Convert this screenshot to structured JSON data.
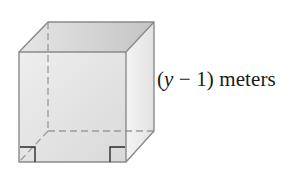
{
  "diagram": {
    "type": "cube",
    "edge_label": {
      "open_paren": "(",
      "variable": "y",
      "rest": " − 1) meters"
    },
    "colors": {
      "edge": "#8a8a8a",
      "hidden_edge": "#9a9a9a",
      "right_angle": "#2b2b2b",
      "face_front": "#e4e4e4",
      "face_top": "#cfcfcf",
      "face_right": "#ececec",
      "text": "#1a1a1a"
    }
  }
}
